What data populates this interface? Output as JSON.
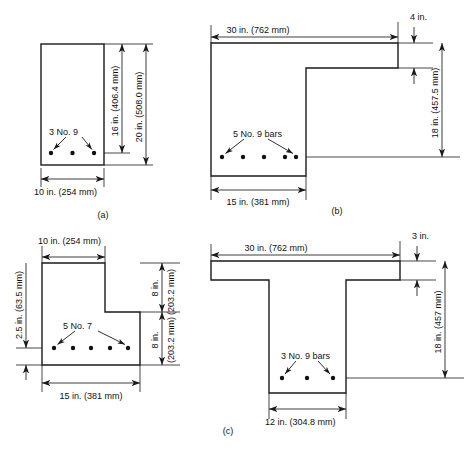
{
  "figure": {
    "background_color": "#ffffff",
    "line_color": "#1a1a1a",
    "panel_labels": {
      "a": "(a)",
      "b": "(b)",
      "c_left": "(c)",
      "c_right": "(c)"
    }
  },
  "panel_a": {
    "name": "rectangular-section",
    "bar_label": "3 No. 9",
    "dim_width": "10 in. (254 mm)",
    "dim_effective_depth": "16 in. (406.4 mm)",
    "dim_total_depth": "20 in. (508.0 mm)",
    "bar_count": 3,
    "panel_label": "(a)"
  },
  "panel_b": {
    "name": "inverted-l-section",
    "bar_label": "5 No. 9 bars",
    "dim_flange_width": "30 in. (762 mm)",
    "dim_flange_thickness": "4 in.",
    "dim_effective_depth": "18 in. (457.5 mm)",
    "dim_web_width": "15 in. (381 mm)",
    "bar_count": 5,
    "panel_label": "(b)"
  },
  "panel_c_left": {
    "name": "stepped-l-section",
    "bar_label": "5 No. 7",
    "dim_top_width": "10 in. (254 mm)",
    "dim_cover": "2.5 in. (63.5 mm)",
    "dim_upper_depth": "8 in.",
    "dim_upper_depth_mm": "(203.2 mm)",
    "dim_lower_depth": "8 in.",
    "dim_lower_depth_mm": "(203.2 mm)",
    "dim_bottom_width": "15 in. (381 mm)",
    "bar_count": 5,
    "panel_label": "(c)"
  },
  "panel_c_right": {
    "name": "t-section",
    "bar_label": "3 No. 9 bars",
    "dim_flange_width": "30 in. (762 mm)",
    "dim_flange_thickness": "3 in.",
    "dim_effective_depth": "18 in. (457 mm)",
    "dim_web_width": "12 in. (304.8 mm)",
    "bar_count": 3,
    "panel_label": "(c)"
  }
}
